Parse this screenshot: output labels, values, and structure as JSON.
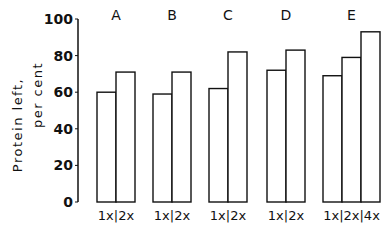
{
  "chart_data": {
    "type": "bar",
    "title": "",
    "xlabel": "",
    "ylabel": "Protein left, per cent",
    "ylabel_lines": [
      "Protein left,",
      "per cent"
    ],
    "ylim": [
      0,
      100
    ],
    "yticks": [
      "0",
      "20",
      "40",
      "60",
      "80",
      "100"
    ],
    "grid": false,
    "legend": null,
    "groups": [
      {
        "name": "A",
        "categories": [
          "1x",
          "2x"
        ],
        "values": [
          60,
          71
        ]
      },
      {
        "name": "B",
        "categories": [
          "1x",
          "2x"
        ],
        "values": [
          59,
          71
        ]
      },
      {
        "name": "C",
        "categories": [
          "1x",
          "2x"
        ],
        "values": [
          62,
          82
        ]
      },
      {
        "name": "D",
        "categories": [
          "1x",
          "2x"
        ],
        "values": [
          72,
          83
        ]
      },
      {
        "name": "E",
        "categories": [
          "1x",
          "2x",
          "4x"
        ],
        "values": [
          69,
          79,
          93
        ]
      }
    ],
    "group_tick_labels": [
      "1x|2x",
      "1x|2x",
      "1x|2x",
      "1x|2x",
      "1x|2x|4x"
    ]
  }
}
